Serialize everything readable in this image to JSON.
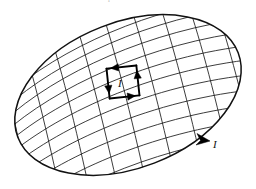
{
  "figure": {
    "kind": "physics-diagram",
    "background_color": "#ffffff",
    "ink_color": "#111111",
    "scan_remnant_text": "the transfer of the current loop",
    "canvas": {
      "width": 256,
      "height": 189
    }
  },
  "disk": {
    "name": "elliptical-surface",
    "center": {
      "x": 128,
      "y": 95
    },
    "semi_major": 118,
    "semi_minor": 73,
    "rotation_deg": -21,
    "outline_color": "#111111",
    "outline_width": 1.5
  },
  "mesh": {
    "name": "curvilinear-grid",
    "u_lines": 11,
    "v_lines": 9,
    "line_color": "#1a1a1a",
    "line_width": 0.85
  },
  "current_loop": {
    "name": "elementary-current-loop",
    "label": "I",
    "circulation": "counterclockwise",
    "position": {
      "x": 123,
      "y": 82
    },
    "size": {
      "width": 30,
      "height": 30
    },
    "edge_width": 1.9,
    "arrows": [
      {
        "edge": "top",
        "direction": "left"
      },
      {
        "edge": "left",
        "direction": "down"
      },
      {
        "edge": "bottom",
        "direction": "right"
      },
      {
        "edge": "right",
        "direction": "up"
      }
    ]
  },
  "boundary_current": {
    "name": "boundary-current",
    "label": "I",
    "arrow_position": {
      "x": 202,
      "y": 140
    },
    "arrow_direction": "right-down",
    "label_position": {
      "x": 215,
      "y": 142
    }
  },
  "labels": [
    {
      "id": "loop-current-label",
      "text": "I",
      "x": 122,
      "y": 86
    },
    {
      "id": "boundary-current-label",
      "text": "I",
      "x": 216,
      "y": 146
    }
  ]
}
